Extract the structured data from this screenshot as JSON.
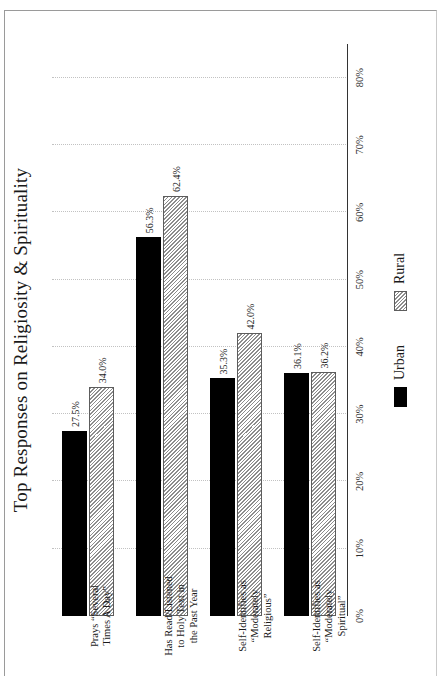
{
  "chart_data": {
    "type": "bar",
    "orientation": "horizontal",
    "title": "Top Responses on Religiosity & Spirituality",
    "xlabel": "",
    "ylabel": "",
    "categories": [
      "Prays “Several Times A Day”",
      "Has Read/Listened to Holy Text in the Past Year",
      "Self-Identifies as “Moderately Religious”",
      "Self-Identifies as “Moderately Spiritual”"
    ],
    "category_lines": [
      [
        "Prays “Several",
        "Times A Day”"
      ],
      [
        "Has Read/Listened",
        "to Holy Text in",
        "the Past Year"
      ],
      [
        "Self-Identifies as",
        "“Moderately",
        "Religious”"
      ],
      [
        "Self-Identifies as",
        "“Moderately",
        "Spiritual”"
      ]
    ],
    "series": [
      {
        "name": "Urban",
        "color": "#000000",
        "pattern": "solid",
        "values": [
          27.5,
          56.3,
          35.3,
          36.1
        ],
        "labels": [
          "27.5%",
          "56.3%",
          "35.3%",
          "36.1%"
        ]
      },
      {
        "name": "Rural",
        "color": "#e3e3e3",
        "pattern": "diagonal-hatch",
        "values": [
          34.0,
          62.4,
          42.0,
          36.2
        ],
        "labels": [
          "34.0%",
          "62.4%",
          "42.0%",
          "36.2%"
        ]
      }
    ],
    "axis": {
      "ticks": [
        0,
        10,
        20,
        30,
        40,
        50,
        60,
        70,
        80
      ],
      "tick_labels": [
        "0%",
        "10%",
        "20%",
        "30%",
        "40%",
        "50%",
        "60%",
        "70%",
        "80%"
      ],
      "lim": [
        0,
        85
      ],
      "grid": true,
      "grid_style": "dotted"
    },
    "legend": {
      "position": "bottom",
      "entries": [
        "Urban",
        "Rural"
      ]
    }
  },
  "colors": {
    "urban": "#000000",
    "rural_fill": "#e3e3e3",
    "rural_edge": "#5d5d5d",
    "grid": "#c2c2c2",
    "axis": "#333333",
    "frame": "#9a9a9a",
    "background": "#ffffff"
  }
}
